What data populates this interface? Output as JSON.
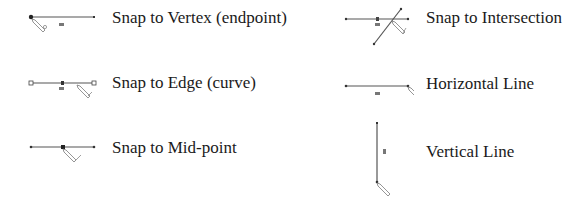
{
  "legend": {
    "items": [
      {
        "id": "vertex",
        "label": "Snap to Vertex (endpoint)",
        "icon": "snap-vertex-icon"
      },
      {
        "id": "edge",
        "label": "Snap to Edge (curve)",
        "icon": "snap-edge-icon"
      },
      {
        "id": "midpoint",
        "label": "Snap to Mid-point",
        "icon": "snap-midpoint-icon"
      },
      {
        "id": "intersection",
        "label": "Snap to Intersection",
        "icon": "snap-intersection-icon"
      },
      {
        "id": "horizontal",
        "label": "Horizontal Line",
        "icon": "horizontal-line-icon"
      },
      {
        "id": "vertical",
        "label": "Vertical Line",
        "icon": "vertical-line-icon"
      }
    ]
  },
  "colors": {
    "line": "#555555",
    "point": "#222222",
    "text": "#1a1a1a"
  }
}
